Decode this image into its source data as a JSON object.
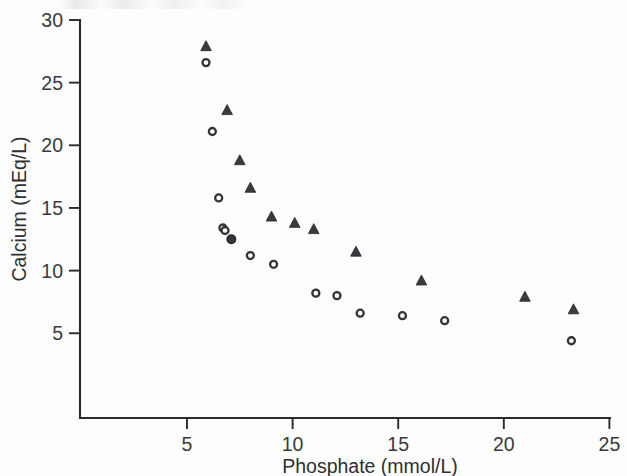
{
  "figure": {
    "background_color": "#fdfdfd",
    "ink_color": "#2b2b2b"
  },
  "chart_data": {
    "type": "scatter",
    "title": "",
    "subtitle": "",
    "xlabel": "Phosphate (mmol/L)",
    "ylabel": "Calcium (mEq/L)",
    "xlim": [
      0,
      25
    ],
    "ylim": [
      0,
      30
    ],
    "xticks": [
      5,
      10,
      15,
      20,
      25
    ],
    "yticks": [
      5,
      10,
      15,
      20,
      25,
      30
    ],
    "xtick_labels": [
      "5",
      "10",
      "15",
      "20",
      "25"
    ],
    "ytick_labels": [
      "5",
      "10",
      "15",
      "20",
      "25",
      "30"
    ],
    "grid": false,
    "legend": null,
    "legend_position": "none",
    "annotations": [],
    "series": [
      {
        "name": "triangle-series",
        "marker": "triangle",
        "marker_fill": "#3a3a40",
        "marker_edge": "#26262b",
        "points": [
          {
            "x": 5.9,
            "y": 27.9
          },
          {
            "x": 6.9,
            "y": 22.8
          },
          {
            "x": 7.5,
            "y": 18.8
          },
          {
            "x": 8.0,
            "y": 16.6
          },
          {
            "x": 9.0,
            "y": 14.3
          },
          {
            "x": 10.1,
            "y": 13.8
          },
          {
            "x": 11.0,
            "y": 13.3
          },
          {
            "x": 13.0,
            "y": 11.5
          },
          {
            "x": 16.1,
            "y": 9.2
          },
          {
            "x": 21.0,
            "y": 7.9
          },
          {
            "x": 23.3,
            "y": 6.9
          }
        ]
      },
      {
        "name": "circle-series",
        "marker": "circle",
        "marker_fill": "#ffffff",
        "marker_edge": "#33333a",
        "points": [
          {
            "x": 5.9,
            "y": 26.6,
            "filled": false
          },
          {
            "x": 6.2,
            "y": 21.1,
            "filled": false
          },
          {
            "x": 6.5,
            "y": 15.8,
            "filled": false
          },
          {
            "x": 6.7,
            "y": 13.4,
            "filled": false
          },
          {
            "x": 6.8,
            "y": 13.2,
            "filled": false
          },
          {
            "x": 7.1,
            "y": 12.5,
            "filled": true
          },
          {
            "x": 8.0,
            "y": 11.2,
            "filled": false
          },
          {
            "x": 9.1,
            "y": 10.5,
            "filled": false
          },
          {
            "x": 11.1,
            "y": 8.2,
            "filled": false
          },
          {
            "x": 12.1,
            "y": 8.0,
            "filled": false
          },
          {
            "x": 13.2,
            "y": 6.6,
            "filled": false
          },
          {
            "x": 15.2,
            "y": 6.4,
            "filled": false
          },
          {
            "x": 17.2,
            "y": 6.0,
            "filled": false
          },
          {
            "x": 23.2,
            "y": 4.4,
            "filled": false
          }
        ]
      }
    ]
  }
}
